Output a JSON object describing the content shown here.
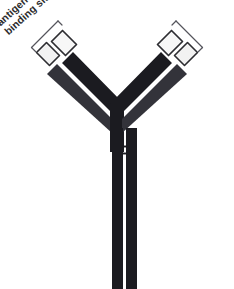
{
  "figure": {
    "background_color": "#ffffff",
    "dark_color": "#1b1b20",
    "mid_color": "#3a3a40",
    "light_fill": "#f4f4f4",
    "outline_color": "#2b2b2b",
    "text_color": "#2b2b2b"
  },
  "labels": {
    "left": {
      "line1": "antigen",
      "line2": "binding site"
    },
    "right": {
      "line1": "antigen",
      "line2": "binding site"
    }
  },
  "parts": {
    "left_arm": "left-arm",
    "right_arm": "right-arm",
    "stem": "stem",
    "hinge": "hinge-lines",
    "left_binding_bracket": "left-binding-bracket",
    "right_binding_bracket": "right-binding-bracket",
    "left_variable_outer": "left-variable-domain-outer",
    "left_variable_inner": "left-variable-domain-inner",
    "right_variable_outer": "right-variable-domain-outer",
    "right_variable_inner": "right-variable-domain-inner"
  }
}
